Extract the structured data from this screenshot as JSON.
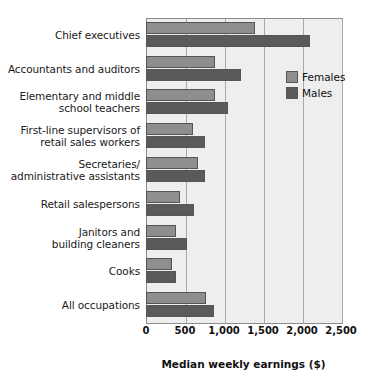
{
  "chart_data": {
    "type": "bar",
    "orientation": "horizontal",
    "title": "",
    "xlabel": "Median weekly earnings ($)",
    "ylabel": "",
    "xlim": [
      0,
      2500
    ],
    "xticks": [
      0,
      500,
      1000,
      1500,
      2000,
      2500
    ],
    "xtick_labels": [
      "0",
      "500",
      "1,000",
      "1,500",
      "2,000",
      "2,500"
    ],
    "grid": true,
    "grid_axis": "x",
    "legend_position": "upper right inside",
    "categories": [
      "Chief executives",
      "Accountants and auditors",
      "Elementary and middle school teachers",
      "First-line supervisors of retail sales workers",
      "Secretaries/ administrative assistants",
      "Retail salespersons",
      "Janitors and building cleaners",
      "Cooks",
      "All occupations"
    ],
    "category_label_lines": [
      [
        "Chief executives"
      ],
      [
        "Accountants and auditors"
      ],
      [
        "Elementary and middle",
        "school teachers"
      ],
      [
        "First-line supervisors of",
        "retail sales workers"
      ],
      [
        "Secretaries/",
        "administrative assistants"
      ],
      [
        "Retail salespersons"
      ],
      [
        "Janitors and",
        "building cleaners"
      ],
      [
        "Cooks"
      ],
      [
        "All occupations"
      ]
    ],
    "series": [
      {
        "name": "Females",
        "color": "#8e8e8e",
        "values": [
          1400,
          880,
          890,
          600,
          670,
          440,
          380,
          330,
          770
        ]
      },
      {
        "name": "Males",
        "color": "#5a5a5a",
        "values": [
          2100,
          1220,
          1050,
          760,
          760,
          610,
          520,
          380,
          870
        ]
      }
    ]
  },
  "legend": {
    "items": [
      {
        "label": "Females",
        "color": "#8e8e8e"
      },
      {
        "label": "Males",
        "color": "#5a5a5a"
      }
    ]
  },
  "colors": {
    "plot_background": "#eeeeee",
    "page_background": "#ffffff",
    "gridline": "#a9a9a9",
    "frame": "#8d8d8d",
    "bar_outline": "#555555",
    "text": "#111111"
  }
}
